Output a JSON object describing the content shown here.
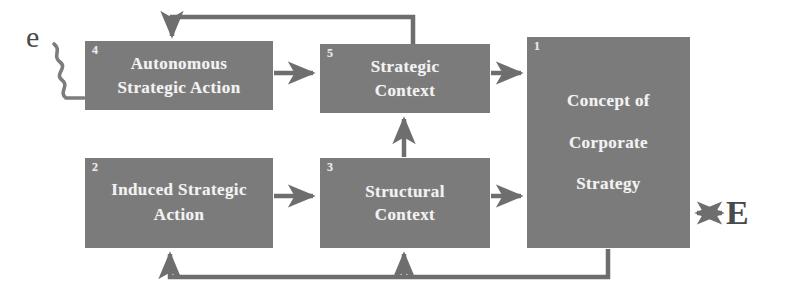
{
  "diagram": {
    "type": "block-flow-diagram",
    "colors": {
      "box_fill": "#7b7b7b",
      "box_text": "#f2f2f2",
      "edge": "#6e6e6e",
      "background": "#ffffff",
      "external_letter": "#4a4a4a"
    },
    "nodes": [
      {
        "id": "box-1",
        "index": "1",
        "label": "Concept of\nCorporate\nStrategy"
      },
      {
        "id": "box-2",
        "index": "2",
        "label": "Induced Strategic\nAction"
      },
      {
        "id": "box-3",
        "index": "3",
        "label": "Structural\nContext"
      },
      {
        "id": "box-4",
        "index": "4",
        "label": "Autonomous\nStrategic Action"
      },
      {
        "id": "box-5",
        "index": "5",
        "label": "Strategic\nContext"
      }
    ],
    "external_labels": [
      {
        "id": "ext-e",
        "text": "e"
      },
      {
        "id": "ext-E",
        "text": "E"
      }
    ],
    "edges": [
      {
        "from": "4",
        "to": "5",
        "style": "arrow"
      },
      {
        "from": "5",
        "to": "1",
        "style": "arrow"
      },
      {
        "from": "2",
        "to": "3",
        "style": "arrow"
      },
      {
        "from": "3",
        "to": "1",
        "style": "arrow"
      },
      {
        "from": "3",
        "to": "5",
        "style": "arrow"
      },
      {
        "from": "5",
        "to": "4",
        "style": "feedback-top"
      },
      {
        "from": "1",
        "to": "2",
        "style": "feedback-bottom"
      },
      {
        "from": "1",
        "to": "3",
        "style": "feedback-bottom-branch"
      },
      {
        "from": "e",
        "to": "4",
        "style": "wavy"
      },
      {
        "from": "1",
        "to": "E",
        "style": "double-arrow"
      }
    ]
  }
}
